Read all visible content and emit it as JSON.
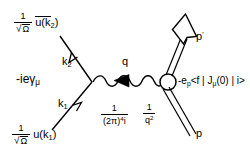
{
  "figure": {
    "background_color": "#ffffff",
    "line_color": "#000000"
  },
  "labels": {
    "outgoing_electron_factor": {
      "numerator": "1",
      "denominator_sqrt": "Ω",
      "spinor": "u(k",
      "spinor_sub": "2",
      "spinor_close": ")",
      "full_text": "1/√Ω ū(k₂)"
    },
    "incoming_electron_factor": {
      "numerator": "1",
      "denominator_sqrt": "Ω",
      "spinor": "u(k",
      "spinor_sub": "1",
      "spinor_close": ")",
      "full_text": "1/√Ω u(k₁)"
    },
    "vertex_factor": {
      "prefix": "-ieγ",
      "sub": "μ",
      "full_text": "-ieγμ"
    },
    "loop_measure": {
      "numerator": "1",
      "denominator_base": "(2π)",
      "denominator_sup": "4",
      "denominator_tail": "i",
      "full_text": "1/(2π)⁴i"
    },
    "propagator": {
      "numerator": "1",
      "denominator_base": "q",
      "denominator_sup": "2",
      "full_text": "1/q²"
    },
    "hadronic_current": {
      "prefix": "-e",
      "prefix_sub": "p",
      "bracket": "<f | J",
      "bracket_sub": "μ",
      "bracket_tail": "(0) | i>",
      "full_text": "-e_p <f|Jμ(0)|i>"
    },
    "momentum_k2": {
      "base": "k",
      "sub": "2"
    },
    "momentum_k1": {
      "base": "k",
      "sub": "1"
    },
    "momentum_q": {
      "base": "q"
    },
    "momentum_p_out": {
      "base": "p",
      "prime": "'"
    },
    "momentum_p_in": {
      "base": "p"
    }
  },
  "lines": {
    "electron_out": {
      "name": "outgoing-electron-line",
      "arrow": "up-left"
    },
    "electron_in": {
      "name": "incoming-electron-line",
      "arrow": "up-right"
    },
    "photon": {
      "name": "virtual-photon-wavy-line",
      "arrow": "left-filled"
    },
    "hadron_out": {
      "name": "outgoing-hadron-double-line",
      "arrow": "up-right-hollow"
    },
    "hadron_in": {
      "name": "incoming-hadron-double-line",
      "arrow": "none"
    }
  },
  "vertices": {
    "lepton_vertex": {
      "name": "lepton-vertex-point"
    },
    "hadron_blob": {
      "name": "hadron-vertex-circle"
    }
  }
}
